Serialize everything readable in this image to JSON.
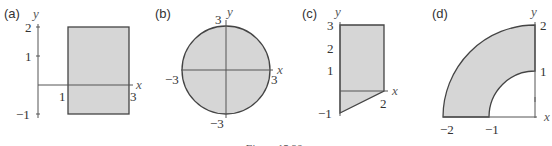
{
  "figure": {
    "caption": "Figure 15.30",
    "panels": [
      {
        "id": "a",
        "label": "(a)",
        "shape": "rectangle",
        "x_var": "x",
        "y_var": "y",
        "y_ticks": [
          "2",
          "1",
          "−1"
        ],
        "x_ticks": [
          "1",
          "3"
        ]
      },
      {
        "id": "b",
        "label": "(b)",
        "shape": "disk",
        "x_var": "x",
        "y_var": "y",
        "y_ticks": [
          "3",
          "−3"
        ],
        "x_ticks": [
          "−3",
          "3"
        ]
      },
      {
        "id": "c",
        "label": "(c)",
        "shape": "trapezoid",
        "x_var": "x",
        "y_var": "y",
        "y_ticks": [
          "3",
          "2",
          "1",
          "−1"
        ],
        "x_ticks": [
          "2"
        ]
      },
      {
        "id": "d",
        "label": "(d)",
        "shape": "quarter-annulus",
        "x_var": "x",
        "y_var": "y",
        "y_ticks": [
          "2",
          "1"
        ],
        "x_ticks": [
          "−2",
          "−1"
        ]
      }
    ]
  }
}
